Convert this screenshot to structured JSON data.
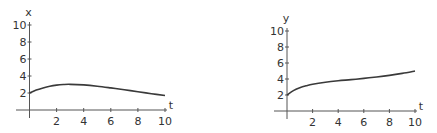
{
  "chart_data": [
    {
      "type": "line",
      "title": "",
      "xlabel": "t",
      "ylabel": "x",
      "xlim": [
        0,
        10
      ],
      "ylim": [
        0,
        10
      ],
      "grid": false,
      "x_ticks": [
        "2",
        "4",
        "6",
        "8",
        "10"
      ],
      "y_ticks": [
        "2",
        "4",
        "6",
        "8",
        "10"
      ],
      "series": [
        {
          "name": "x(t)",
          "x": [
            0,
            0.5,
            1,
            1.5,
            2,
            2.5,
            3,
            4,
            5,
            6,
            7,
            8,
            9,
            10
          ],
          "values": [
            2.0,
            2.35,
            2.6,
            2.8,
            2.93,
            3.0,
            3.02,
            2.95,
            2.8,
            2.6,
            2.38,
            2.15,
            1.92,
            1.7
          ]
        }
      ]
    },
    {
      "type": "line",
      "title": "",
      "xlabel": "t",
      "ylabel": "y",
      "xlim": [
        0,
        10
      ],
      "ylim": [
        0,
        10
      ],
      "grid": false,
      "x_ticks": [
        "2",
        "4",
        "6",
        "8",
        "10"
      ],
      "y_ticks": [
        "2",
        "4",
        "6",
        "8",
        "10"
      ],
      "series": [
        {
          "name": "y(t)",
          "x": [
            0,
            0.5,
            1,
            1.5,
            2,
            3,
            4,
            5,
            6,
            7,
            8,
            9,
            10
          ],
          "values": [
            2.0,
            2.55,
            2.9,
            3.15,
            3.35,
            3.6,
            3.78,
            3.92,
            4.08,
            4.25,
            4.45,
            4.7,
            5.0
          ]
        }
      ]
    }
  ],
  "plots": [
    {
      "y_title": "x",
      "x_title": "t"
    },
    {
      "y_title": "y",
      "x_title": "t"
    }
  ]
}
